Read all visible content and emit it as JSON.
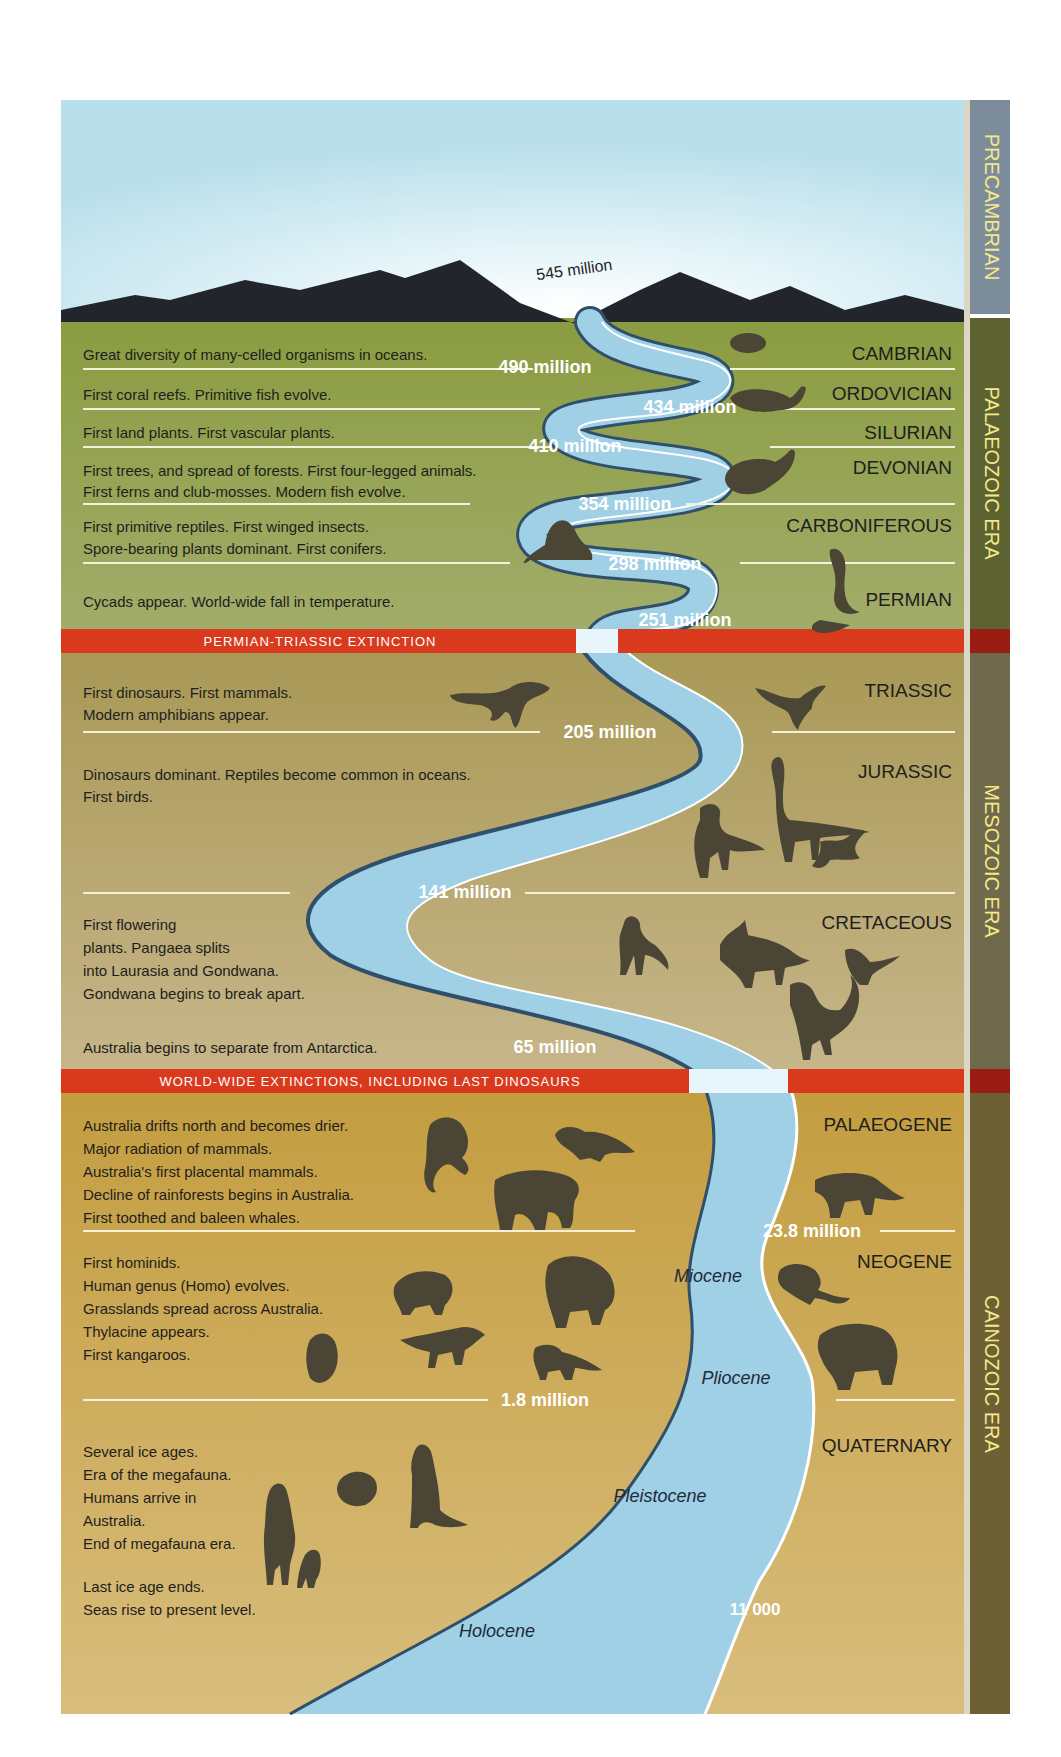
{
  "colors": {
    "sky_top": "#bfe3ee",
    "sky_glow": "#ffffff",
    "mountain": "#22252b",
    "palaeozoic": "#8fa04a",
    "mesozoic": "#b1a06a",
    "cainozoic": "#c9a450",
    "extinction_band": "#d93a1e",
    "river": "#9fd0e6",
    "river_edge": "#2f4f6a",
    "river_bank": "#ffffff",
    "silhouette": "#4a4535",
    "label_dark": "#1e1e1e",
    "label_white": "#ffffff",
    "era_bar_precambrian": "#7d8c9a",
    "era_bar_palaeozoic": "#5c6232",
    "era_bar_mesozoic": "#6f6a4c",
    "era_bar_cainozoic": "#6e6035",
    "era_text": "#f4e98a"
  },
  "eras": [
    {
      "id": "precambrian",
      "label": "PRECAMBRIAN"
    },
    {
      "id": "palaeozoic",
      "label": "PALAEOZOIC ERA"
    },
    {
      "id": "mesozoic",
      "label": "MESOZOIC ERA"
    },
    {
      "id": "cainozoic",
      "label": "CAINOZOIC ERA"
    }
  ],
  "start_date": "545 million",
  "periods": [
    {
      "name": "CAMBRIAN",
      "era": "palaeozoic",
      "end": "490 million",
      "events": [
        "Great diversity of many-celled organisms in oceans."
      ]
    },
    {
      "name": "ORDOVICIAN",
      "era": "palaeozoic",
      "end": "434 million",
      "events": [
        "First coral reefs. Primitive fish evolve."
      ]
    },
    {
      "name": "SILURIAN",
      "era": "palaeozoic",
      "end": "410 million",
      "events": [
        "First land plants. First vascular plants."
      ]
    },
    {
      "name": "DEVONIAN",
      "era": "palaeozoic",
      "end": "354 million",
      "events": [
        "First trees, and spread of forests. First four-legged animals.",
        "First ferns and club-mosses. Modern fish evolve."
      ]
    },
    {
      "name": "CARBONIFEROUS",
      "era": "palaeozoic",
      "end": "298 million",
      "events": [
        "First primitive reptiles. First winged insects.",
        "Spore-bearing plants dominant. First conifers."
      ]
    },
    {
      "name": "PERMIAN",
      "era": "palaeozoic",
      "end": "251 million",
      "events": [
        "Cycads appear. World-wide fall in temperature."
      ]
    },
    {
      "name": "TRIASSIC",
      "era": "mesozoic",
      "end": "205 million",
      "events": [
        "First dinosaurs. First mammals.",
        "Modern amphibians appear."
      ]
    },
    {
      "name": "JURASSIC",
      "era": "mesozoic",
      "end": "141 million",
      "events": [
        "Dinosaurs dominant. Reptiles become common in oceans.",
        "First birds."
      ]
    },
    {
      "name": "CRETACEOUS",
      "era": "mesozoic",
      "end": "65 million",
      "events": [
        "First flowering",
        "plants. Pangaea splits",
        "into Laurasia and Gondwana.",
        "Gondwana begins to break apart.",
        "",
        "Australia begins to separate from Antarctica."
      ]
    },
    {
      "name": "PALAEOGENE",
      "era": "cainozoic",
      "end": "23.8 million",
      "events": [
        "Australia drifts north and becomes drier.",
        "Major radiation of mammals.",
        "Australia's first placental mammals.",
        "Decline of rainforests begins in Australia.",
        "First toothed and baleen whales."
      ]
    },
    {
      "name": "NEOGENE",
      "era": "cainozoic",
      "end": "1.8 million",
      "events": [
        "First hominids.",
        "Human genus (Homo) evolves.",
        "Grasslands spread across Australia.",
        "Thylacine appears.",
        "First kangaroos."
      ]
    },
    {
      "name": "QUATERNARY",
      "era": "cainozoic",
      "end": "",
      "events": [
        "Several ice ages.",
        "Era of the megafauna.",
        "Humans arrive in",
        "Australia.",
        "End of megafauna era.",
        "",
        "Last ice age ends.",
        "Seas rise to present level."
      ]
    }
  ],
  "extinctions": [
    {
      "label": "PERMIAN-TRIASSIC EXTINCTION"
    },
    {
      "label": "WORLD-WIDE EXTINCTIONS, INCLUDING LAST DINOSAURS"
    }
  ],
  "epochs": [
    {
      "label": "Miocene"
    },
    {
      "label": "Pliocene"
    },
    {
      "label": "Pleistocene"
    },
    {
      "label": "Holocene"
    }
  ],
  "holocene_start": "11 000"
}
